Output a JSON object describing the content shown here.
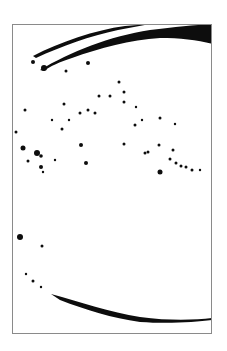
{
  "artwork": {
    "description": "Abstract ink brush-stroke artwork",
    "background": "#ffffff",
    "ink": "#0d0d0d",
    "frame": {
      "x": 12,
      "y": 24,
      "width": 200,
      "height": 310,
      "color": "#8a8a8a"
    },
    "strokes": [
      {
        "name": "top-upper-stroke",
        "d": "M33,56 C60,42 95,30 125,26 L150,24 L118,30 C90,36 62,46 36,58 Z"
      },
      {
        "name": "top-main-stroke",
        "d": "M40,70 C70,52 110,36 150,30 C175,27 195,25 213,24 L213,44 C198,40 180,38 160,38 C130,40 100,48 72,58 C60,62 50,66 44,71 Z"
      },
      {
        "name": "bottom-stroke",
        "d": "M51,294 C80,302 110,312 140,317 C170,321 195,320 212,318 L212,320 C195,322 170,324 140,322 C112,318 86,310 60,300 Z"
      }
    ],
    "dots": [
      [
        33,
        62,
        2
      ],
      [
        44,
        68,
        3
      ],
      [
        88,
        63,
        2
      ],
      [
        66,
        71,
        1.5
      ],
      [
        119,
        82,
        1.5
      ],
      [
        124,
        92,
        1.5
      ],
      [
        99,
        96,
        1.5
      ],
      [
        110,
        96,
        1.5
      ],
      [
        124,
        102,
        1.5
      ],
      [
        25,
        110,
        1.5
      ],
      [
        64,
        104,
        1.5
      ],
      [
        80,
        113,
        1.5
      ],
      [
        88,
        110,
        1.5
      ],
      [
        95,
        113,
        1.5
      ],
      [
        52,
        120,
        1.2
      ],
      [
        69,
        120,
        1.2
      ],
      [
        16,
        132,
        1.5
      ],
      [
        62,
        129,
        1.5
      ],
      [
        135,
        125,
        1.5
      ],
      [
        142,
        120,
        1.2
      ],
      [
        136,
        107,
        1.2
      ],
      [
        160,
        118,
        1.5
      ],
      [
        175,
        124,
        1.2
      ],
      [
        23,
        148,
        2.5
      ],
      [
        37,
        153,
        3
      ],
      [
        41,
        156,
        1.8
      ],
      [
        81,
        145,
        2
      ],
      [
        124,
        144,
        1.5
      ],
      [
        145,
        153,
        1.5
      ],
      [
        148,
        152,
        1.5
      ],
      [
        159,
        145,
        1.5
      ],
      [
        173,
        150,
        1.5
      ],
      [
        170,
        159,
        1.5
      ],
      [
        176,
        163,
        1.5
      ],
      [
        181,
        166,
        1.5
      ],
      [
        186,
        167,
        1.5
      ],
      [
        192,
        170,
        1.5
      ],
      [
        200,
        170,
        1.2
      ],
      [
        28,
        161,
        1.5
      ],
      [
        41,
        167,
        2
      ],
      [
        86,
        163,
        2
      ],
      [
        160,
        172,
        2.5
      ],
      [
        55,
        160,
        1.2
      ],
      [
        43,
        172,
        1.2
      ],
      [
        20,
        237,
        3
      ],
      [
        42,
        246,
        1.5
      ],
      [
        26,
        274,
        1.2
      ],
      [
        33,
        281,
        1.5
      ],
      [
        41,
        287,
        1.2
      ]
    ]
  }
}
